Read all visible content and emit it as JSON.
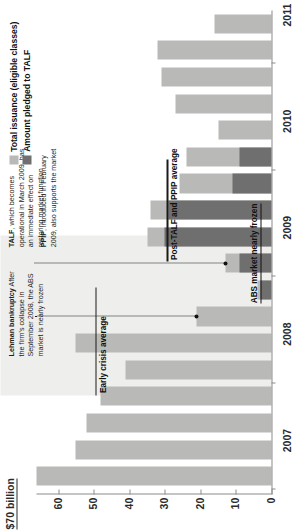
{
  "figure": {
    "unit_label": "$70 billion",
    "legend": [
      {
        "label": "Total issuance (eligible classes)",
        "color": "#b9b9b7",
        "key": "total"
      },
      {
        "label": "Amount pledged to TALF",
        "color": "#6f6f6f",
        "key": "talf"
      }
    ],
    "annotations": [
      {
        "id": "lehman",
        "title": "Lehman bankruptcy",
        "body": "After the firm's collapse in September 2008, the ABS market is nearly frozen"
      },
      {
        "id": "talf",
        "title": "TALF",
        "body": ", which becomes operational in March 2009, has an immediate effect on restoring market function"
      },
      {
        "id": "ppip",
        "title": "PPIP",
        "body": ", introduced in February 2009, also supports the market"
      }
    ],
    "reference_lines": [
      {
        "id": "early-crisis",
        "label": "Early crisis average",
        "value": 49.5
      },
      {
        "id": "post-talf",
        "label": "Post-TALF and PPIP average",
        "value": 29.5
      }
    ],
    "callout_labels": [
      {
        "id": "abs-frozen",
        "label": "ABS market nearly frozen"
      }
    ]
  },
  "chart_data": {
    "type": "bar",
    "title": "",
    "subtitle": "",
    "xlabel": "",
    "ylabel": "$70 billion",
    "ylim": [
      0,
      70
    ],
    "yticks": [
      0,
      10,
      20,
      30,
      40,
      50,
      60
    ],
    "ytick_labels": [
      "0",
      "10",
      "20",
      "30",
      "40",
      "50",
      "60"
    ],
    "grid": false,
    "legend_position": "top-right",
    "x_axis_type": "quarterly",
    "xtick_labels": [
      "2007",
      "2008",
      "2009",
      "2010",
      "2011"
    ],
    "categories": [
      "2007 Q1",
      "2007 Q2",
      "2007 Q3",
      "2007 Q4",
      "2008 Q1",
      "2008 Q2",
      "2008 Q3",
      "2008 Q4",
      "2009 Q1",
      "2009 Q2",
      "2009 Q3",
      "2009 Q4",
      "2010 Q1",
      "2010 Q2",
      "2010 Q3",
      "2010 Q4",
      "2011 Q1",
      "2011 Q2"
    ],
    "series": [
      {
        "name": "Total issuance (eligible classes)",
        "color": "#b9b9b7",
        "values": [
          66,
          55,
          52,
          48,
          41,
          55,
          21,
          4,
          13,
          35,
          34,
          26,
          24,
          15,
          27,
          31,
          32,
          16
        ]
      },
      {
        "name": "Amount pledged to TALF",
        "color": "#6f6f6f",
        "values": [
          0,
          0,
          0,
          0,
          0,
          0,
          0,
          3,
          9,
          30,
          29,
          11,
          9,
          0,
          0,
          0,
          0,
          0
        ]
      }
    ]
  }
}
